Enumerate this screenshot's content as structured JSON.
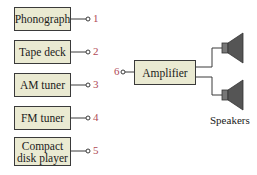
{
  "sources": [
    {
      "label": "Phonograph",
      "number": "1"
    },
    {
      "label": "Tape deck",
      "number": "2"
    },
    {
      "label": "AM tuner",
      "number": "3"
    },
    {
      "label": "FM tuner",
      "number": "4"
    },
    {
      "label": "Compact disk player",
      "number": "5"
    }
  ],
  "amplifier": {
    "label": "Amplifier",
    "input_number": "6"
  },
  "speakers": {
    "label": "Speakers"
  },
  "colors": {
    "box_fill": "#eaead2",
    "number": "#b04a55",
    "line": "#3a3a3a"
  }
}
